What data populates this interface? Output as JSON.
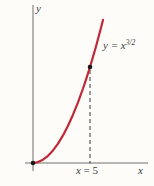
{
  "labels": {
    "y_axis": "y",
    "x_axis": "x",
    "curve_base": "y = x",
    "curve_exponent": "3/2",
    "guide_var": "x",
    "guide_rest": " = 5"
  },
  "colors": {
    "curve": "#bf2838",
    "axis": "#6f6f6f",
    "dash": "#3a3a3a",
    "point": "#1a1a1a",
    "text": "#3b3b3b",
    "background": "#fdfcf9"
  },
  "chart_data": {
    "type": "line",
    "title": "",
    "function": "y = x^(3/2)",
    "curve_label": "y = x^{3/2}",
    "xlabel": "x",
    "ylabel": "y",
    "x_range": [
      0,
      6.2
    ],
    "y_range": [
      0,
      15.5
    ],
    "grid": false,
    "marked_points": [
      {
        "x": 0,
        "y": 0
      },
      {
        "x": 5,
        "y": 11.18
      }
    ],
    "dashed_guide": {
      "x": 5,
      "from_y": 0,
      "to_y": 11.18,
      "label": "x = 5"
    },
    "ticks": [
      {
        "axis": "x",
        "value": 5,
        "label": "x = 5"
      }
    ],
    "pixel_geometry": {
      "canvas": {
        "width": 154,
        "height": 186
      },
      "x_axis": {
        "x1": 25,
        "y1": 163,
        "x2": 148,
        "y2": 163
      },
      "y_axis": {
        "x1": 33,
        "y1": 5,
        "x2": 33,
        "y2": 171
      },
      "dash_line": {
        "x1": 90,
        "y1": 70,
        "x2": 90,
        "y2": 163.5
      },
      "dash_pattern": "4 3",
      "origin_dot": {
        "cx": 33,
        "cy": 163,
        "r": 2.3
      },
      "point_dot": {
        "cx": 90,
        "cy": 67,
        "r": 2.3
      },
      "curve_width": 2.2,
      "curve_px": [
        [
          33,
          163
        ],
        [
          38,
          162.1
        ],
        [
          43,
          159.7
        ],
        [
          48,
          155.8
        ],
        [
          53,
          150.4
        ],
        [
          58,
          143.6
        ],
        [
          63,
          135.4
        ],
        [
          68,
          125.8
        ],
        [
          73,
          114.7
        ],
        [
          78,
          102.3
        ],
        [
          83,
          88.5
        ],
        [
          86,
          79.6
        ],
        [
          88,
          73.4
        ],
        [
          90,
          67
        ],
        [
          93,
          56.9
        ],
        [
          96,
          46.5
        ],
        [
          99,
          35.3
        ],
        [
          101,
          27.8
        ],
        [
          103,
          19.9
        ]
      ]
    }
  }
}
